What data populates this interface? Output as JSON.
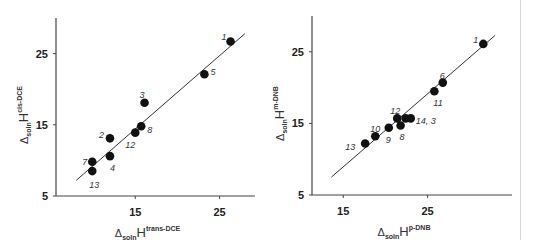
{
  "chart_data": [
    {
      "type": "scatter",
      "title": "",
      "xlabel": "ΔsolnH^trans-DCE",
      "ylabel": "ΔsolnH^cis-DCE",
      "xlabel_parts": {
        "delta": "Δ",
        "sub": "soln",
        "main": "H",
        "sup": "trans-DCE"
      },
      "ylabel_parts": {
        "delta": "Δ",
        "sub": "soln",
        "main": "H",
        "sup": "cis-DCE"
      },
      "xlim": [
        5.6,
        29.2
      ],
      "ylim": [
        5,
        30
      ],
      "xticks": [
        15,
        25
      ],
      "yticks": [
        5,
        15,
        25
      ],
      "grid": false,
      "legend": "none",
      "points": [
        {
          "label": "1",
          "x": 26.3,
          "y": 26.7
        },
        {
          "label": "5",
          "x": 23.2,
          "y": 22.1
        },
        {
          "label": "3",
          "x": 16.1,
          "y": 18.1
        },
        {
          "label": "8",
          "x": 15.7,
          "y": 14.8
        },
        {
          "label": "12",
          "x": 15.0,
          "y": 13.9
        },
        {
          "label": "2",
          "x": 12.0,
          "y": 13.1
        },
        {
          "label": "4",
          "x": 12.0,
          "y": 10.6
        },
        {
          "label": "7",
          "x": 9.9,
          "y": 9.8
        },
        {
          "label": "13",
          "x": 9.9,
          "y": 8.5
        }
      ],
      "fit_line": {
        "x1": 8.0,
        "y1": 7.2,
        "x2": 28.0,
        "y2": 27.8
      }
    },
    {
      "type": "scatter",
      "title": "",
      "xlabel": "ΔsolnH^p-DNB",
      "ylabel": "ΔsolnH^m-DNB",
      "xlabel_parts": {
        "delta": "Δ",
        "sub": "soln",
        "main": "H",
        "sup": "p-DNB"
      },
      "ylabel_parts": {
        "delta": "Δ",
        "sub": "soln",
        "main": "H",
        "sup": "m-DNB"
      },
      "xlim": [
        11.3,
        35.0
      ],
      "ylim": [
        5,
        30
      ],
      "xticks": [
        15,
        25
      ],
      "yticks": [
        5,
        15,
        25
      ],
      "grid": false,
      "legend": "none",
      "points": [
        {
          "label": "1",
          "x": 31.6,
          "y": 26.1
        },
        {
          "label": "6",
          "x": 26.8,
          "y": 20.7
        },
        {
          "label": "11",
          "x": 25.8,
          "y": 19.5
        },
        {
          "label": "12",
          "x": 21.4,
          "y": 15.7
        },
        {
          "label": "14",
          "x": 22.4,
          "y": 15.7
        },
        {
          "label": "3",
          "x": 23.0,
          "y": 15.7
        },
        {
          "label": "8",
          "x": 21.8,
          "y": 14.7
        },
        {
          "label": "9",
          "x": 20.4,
          "y": 14.4
        },
        {
          "label": "10",
          "x": 18.8,
          "y": 13.2
        },
        {
          "label": "13",
          "x": 17.6,
          "y": 12.2
        }
      ],
      "point_label_overrides": {
        "14": "14, 3",
        "3": ""
      },
      "fit_line": {
        "x1": 13.6,
        "y1": 7.5,
        "x2": 33.0,
        "y2": 27.3
      }
    }
  ],
  "colors": {
    "points": "#111111",
    "axes": "#444444",
    "fit_line": "#333333",
    "divider": "#d6d6d6"
  }
}
